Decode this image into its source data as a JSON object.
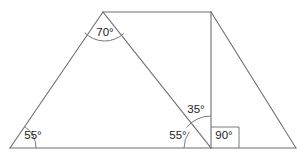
{
  "figure": {
    "stroke_color": "#6f6f6f",
    "label_color": "#1d1d1d",
    "background": "#ffffff",
    "vertices": {
      "bottom_left": {
        "x": 10,
        "y": 148
      },
      "apex": {
        "x": 103,
        "y": 12
      },
      "top_right": {
        "x": 211,
        "y": 12
      },
      "base_mid": {
        "x": 211,
        "y": 148
      },
      "bottom_right": {
        "x": 296,
        "y": 148
      }
    },
    "angles": [
      {
        "id": "angle-bottom-left",
        "value": "55°",
        "vertex": "bottom_left",
        "label_x": 33,
        "label_y": 136,
        "arc_radius": 26,
        "marker": "arc"
      },
      {
        "id": "angle-apex",
        "value": "70°",
        "vertex": "apex",
        "label_x": 105,
        "label_y": 33,
        "arc_radius": 28,
        "marker": "arc"
      },
      {
        "id": "angle-upper-middle",
        "value": "35°",
        "vertex": "base_mid",
        "label_x": 196,
        "label_y": 110,
        "arc_radius": 32,
        "marker": "arc"
      },
      {
        "id": "angle-lower-middle",
        "value": "55°",
        "vertex": "base_mid",
        "label_x": 178,
        "label_y": 136,
        "arc_radius": 27,
        "marker": "arc"
      },
      {
        "id": "angle-right-angle",
        "value": "90°",
        "vertex": "base_mid",
        "label_x": 224,
        "label_y": 136,
        "arc_radius": 0,
        "marker": "square"
      }
    ],
    "segments": [
      {
        "id": "base-line",
        "from": "bottom_left",
        "to": "bottom_right"
      },
      {
        "id": "left-slant-line",
        "from": "bottom_left",
        "to": "apex"
      },
      {
        "id": "top-line",
        "from": "apex",
        "to": "top_right"
      },
      {
        "id": "right-slant-line",
        "from": "top_right",
        "to": "bottom_right"
      },
      {
        "id": "vertical-line",
        "from": "top_right",
        "to": "base_mid"
      },
      {
        "id": "diagonal-line",
        "from": "apex",
        "to": "base_mid"
      }
    ]
  }
}
